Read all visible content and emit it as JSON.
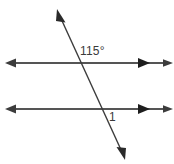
{
  "figure": {
    "type": "geometry-diagram",
    "background_color": "#ffffff",
    "width": 174,
    "height": 164,
    "labels": {
      "angle_measure": "115°",
      "angle_name": "1"
    },
    "colors": {
      "parallel_line": "#555555",
      "transversal_line": "#3c3c3c",
      "label_text": "#3a3a3a"
    },
    "lines": [
      {
        "name": "upper-parallel-line",
        "orientation": "horizontal",
        "y": 63,
        "x_start": 6,
        "x_end": 172,
        "stroke": "#555555",
        "stroke_width": 2,
        "arrow_left": true,
        "arrow_right": true,
        "inner_arrow_x": 148
      },
      {
        "name": "lower-parallel-line",
        "orientation": "horizontal",
        "y": 109,
        "x_start": 6,
        "x_end": 172,
        "stroke": "#555555",
        "stroke_width": 2,
        "arrow_left": true,
        "arrow_right": true,
        "inner_arrow_x": 148
      },
      {
        "name": "transversal-line",
        "orientation": "diagonal",
        "x_start": 57,
        "y_start": 10,
        "x_end": 124,
        "y_end": 157,
        "stroke": "#3c3c3c",
        "stroke_width": 1.4,
        "arrow_start": true,
        "arrow_end": true
      }
    ],
    "intersections": [
      {
        "name": "upper-intersection",
        "x": 79,
        "y": 63
      },
      {
        "name": "lower-intersection",
        "x": 101,
        "y": 109
      }
    ]
  }
}
